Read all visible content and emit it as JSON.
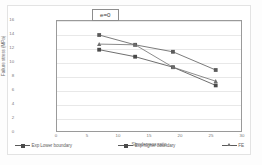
{
  "figure": {
    "annotation": "e=0"
  },
  "chart_data": {
    "type": "line",
    "title": "",
    "xlabel": "Slenderness ratio",
    "ylabel": "Failure stress (MPa)",
    "xlim": [
      0,
      30
    ],
    "ylim": [
      0,
      16
    ],
    "xticks": [
      0,
      5,
      10,
      15,
      20,
      25,
      30
    ],
    "xtick_labels": [
      "0",
      "5",
      "10",
      "15",
      "20",
      "25",
      "30"
    ],
    "yticks": [
      0,
      2,
      4,
      6,
      8,
      10,
      12,
      14,
      16
    ],
    "ytick_labels": [
      "0",
      "2",
      "4",
      "6",
      "8",
      "10",
      "12",
      "14",
      "16"
    ],
    "grid": "horizontal",
    "legend_position": "bottom-inside",
    "annotation": "e=0",
    "x": [
      6.8,
      12.6,
      18.7,
      25.6
    ],
    "series": [
      {
        "name": "Exp Lower boundary",
        "marker": "square",
        "color": "#4a4a4a",
        "values": [
          11.9,
          10.9,
          9.4,
          6.8
        ]
      },
      {
        "name": "Exp higher boundary",
        "marker": "square",
        "color": "#5a5a5a",
        "values": [
          14.0,
          12.6,
          11.6,
          9.0
        ]
      },
      {
        "name": "FE",
        "marker": "triangle",
        "color": "#6f6f6f",
        "values": [
          12.7,
          12.6,
          9.4,
          7.4
        ]
      }
    ]
  },
  "axis": {
    "ytick_0": "0",
    "ytick_1": "2",
    "ytick_2": "4",
    "ytick_3": "6",
    "ytick_4": "8",
    "ytick_5": "10",
    "ytick_6": "12",
    "ytick_7": "14",
    "ytick_8": "16",
    "xtick_0": "0",
    "xtick_1": "5",
    "xtick_2": "10",
    "xtick_3": "15",
    "xtick_4": "20",
    "xtick_5": "25",
    "xtick_6": "30",
    "xtitle": "Slenderness ratio",
    "ytitle": "Failure stress (MPa)"
  },
  "legend": {
    "items": [
      {
        "label": "Exp Lower boundary"
      },
      {
        "label": "Exp higher boundary"
      },
      {
        "label": "FE"
      }
    ]
  }
}
